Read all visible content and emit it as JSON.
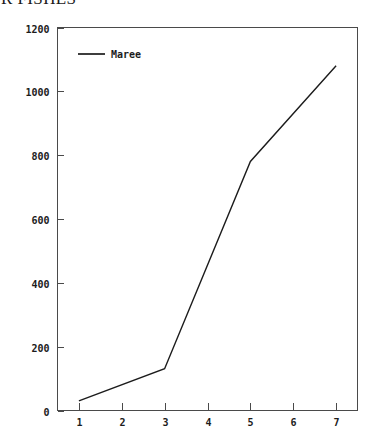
{
  "title": {
    "text": "R FISHES",
    "clipped_top": true
  },
  "chart_data": {
    "type": "line",
    "title": "R FISHES",
    "xlabel": "",
    "ylabel": "",
    "xlim": [
      0.5,
      7.5
    ],
    "ylim": [
      0,
      1200
    ],
    "grid": false,
    "legend_position": "top-left",
    "x": [
      1,
      3,
      5,
      7
    ],
    "x_tick_labels": [
      "1",
      "2",
      "3",
      "4",
      "5",
      "6",
      "7"
    ],
    "x_ticks": [
      1,
      2,
      3,
      4,
      5,
      6,
      7
    ],
    "y_ticks": [
      0,
      200,
      400,
      600,
      800,
      1000,
      1200
    ],
    "y_tick_labels": [
      "0",
      "200",
      "400",
      "600",
      "800",
      "1000",
      "1200"
    ],
    "series": [
      {
        "name": "Maree",
        "color": "#1c1c1c",
        "x": [
          1,
          3,
          5,
          7
        ],
        "values": [
          30,
          131,
          780,
          1080
        ]
      }
    ]
  },
  "legend": {
    "entries": [
      {
        "label": "Maree",
        "color": "#1c1c1c"
      }
    ]
  },
  "colors": {
    "axis": "#4a4a4a",
    "text": "#1c1c1c",
    "series": "#1c1c1c",
    "background": "#ffffff"
  }
}
